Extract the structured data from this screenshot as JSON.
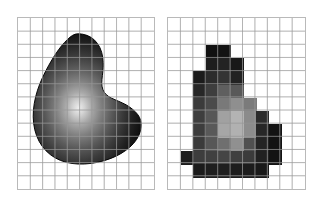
{
  "figure": {
    "background_color": "#ffffff",
    "panel_border_color": "#b9b9b9",
    "grid_line_color": "#9a9a9a",
    "grid_minor_color": "#c8c8c8",
    "caption": "",
    "panel_count": 2
  },
  "panels": [
    {
      "id": "continuous",
      "name": "continuous-shaded-shape",
      "label": "",
      "x": 17,
      "y": 17,
      "width": 138,
      "height": 173,
      "grid": {
        "columns": 11,
        "rows": 13,
        "cell_width": 12.5,
        "cell_height": 13.3,
        "visible": true
      },
      "shape": {
        "type": "smooth-blob",
        "fill_mode": "radial-gradient-shaded",
        "highlight_center_x_pct": 42,
        "highlight_center_y_pct": 57,
        "highlight_color": "#e8e8e8",
        "mid_color": "#6e6e6e",
        "edge_color": "#111111",
        "outline_color": "#000000"
      }
    },
    {
      "id": "pixelated",
      "name": "pixelated-quantized-shape",
      "label": "",
      "x": 167,
      "y": 17,
      "width": 139,
      "height": 173,
      "grid": {
        "columns": 11,
        "rows": 13,
        "cell_width": 12.6,
        "cell_height": 13.3,
        "visible": true
      },
      "shape": {
        "type": "pixel-mosaic",
        "fill_mode": "quantized-grayscale",
        "palette": [
          "#0d0d0d",
          "#1f1f1f",
          "#2e2e2e",
          "#3d3d3d",
          "#4d4d4d",
          "#5c5c5c",
          "#707070",
          "#858585",
          "#9b9b9b",
          "#b2b2b2",
          "#c2c2c2"
        ]
      }
    }
  ],
  "chart_data": {
    "type": "heatmap",
    "title": "",
    "subtitle": "",
    "xlabel": "",
    "ylabel": "",
    "legend": [],
    "grid": true,
    "columns": 11,
    "rows": 13,
    "cell_matrix": [
      [
        null,
        null,
        null,
        null,
        null,
        null,
        null,
        null,
        null,
        null,
        null
      ],
      [
        null,
        null,
        null,
        null,
        null,
        null,
        null,
        null,
        null,
        null,
        null
      ],
      [
        null,
        null,
        null,
        "#121212",
        "#121212",
        null,
        null,
        null,
        null,
        null,
        null
      ],
      [
        null,
        null,
        null,
        "#1d1d1d",
        "#212121",
        "#1a1a1a",
        null,
        null,
        null,
        null,
        null
      ],
      [
        null,
        null,
        "#1c1c1c",
        "#2b2b2b",
        "#323232",
        "#242424",
        null,
        null,
        null,
        null,
        null
      ],
      [
        null,
        null,
        "#262626",
        "#3d3d3d",
        "#5e5e5e",
        "#585858",
        null,
        null,
        null,
        null,
        null
      ],
      [
        null,
        null,
        "#3a3a3a",
        "#4a4a4a",
        "#787878",
        "#8e8e8e",
        "#7a7a7a",
        null,
        null,
        null,
        null
      ],
      [
        null,
        null,
        "#3d3d3d",
        "#565656",
        "#a0a0a0",
        "#b2b2b2",
        "#8a8a8a",
        "#2b2b2b",
        null,
        null,
        null
      ],
      [
        null,
        null,
        "#3c3c3c",
        "#585858",
        "#a5a5a5",
        "#b0b0b0",
        "#8c8c8c",
        "#262626",
        "#121212",
        null,
        null
      ],
      [
        null,
        null,
        "#3a3a3a",
        "#565656",
        "#6e6e6e",
        "#8f8f8f",
        "#4f4f4f",
        "#232323",
        "#121212",
        null,
        null
      ],
      [
        null,
        "#1c1c1c",
        "#3c3c3c",
        "#3f3f3f",
        "#444444",
        "#3e3e3e",
        "#3a3a3a",
        "#202020",
        "#121212",
        null,
        null
      ],
      [
        null,
        null,
        "#1a1a1a",
        "#1d1d1d",
        "#1e1e1e",
        "#1c1c1c",
        "#1b1b1b",
        "#181818",
        null,
        null,
        null
      ],
      [
        null,
        null,
        null,
        null,
        null,
        null,
        null,
        null,
        null,
        null,
        null
      ]
    ]
  },
  "pixel_cells": [
    {
      "c": 3,
      "r": 2,
      "color": "#111111"
    },
    {
      "c": 4,
      "r": 2,
      "color": "#131313"
    },
    {
      "c": 3,
      "r": 3,
      "color": "#1e1e1e"
    },
    {
      "c": 4,
      "r": 3,
      "color": "#232323"
    },
    {
      "c": 5,
      "r": 3,
      "color": "#181818"
    },
    {
      "c": 2,
      "r": 4,
      "color": "#1b1b1b"
    },
    {
      "c": 3,
      "r": 4,
      "color": "#2c2c2c"
    },
    {
      "c": 4,
      "r": 4,
      "color": "#343434"
    },
    {
      "c": 5,
      "r": 4,
      "color": "#222222"
    },
    {
      "c": 2,
      "r": 5,
      "color": "#272727"
    },
    {
      "c": 3,
      "r": 5,
      "color": "#3e3e3e"
    },
    {
      "c": 4,
      "r": 5,
      "color": "#5f5f5f"
    },
    {
      "c": 5,
      "r": 5,
      "color": "#595959"
    },
    {
      "c": 2,
      "r": 6,
      "color": "#3b3b3b"
    },
    {
      "c": 3,
      "r": 6,
      "color": "#4b4b4b"
    },
    {
      "c": 4,
      "r": 6,
      "color": "#797979"
    },
    {
      "c": 5,
      "r": 6,
      "color": "#8f8f8f"
    },
    {
      "c": 6,
      "r": 6,
      "color": "#7b7b7b"
    },
    {
      "c": 2,
      "r": 7,
      "color": "#3e3e3e"
    },
    {
      "c": 3,
      "r": 7,
      "color": "#575757"
    },
    {
      "c": 4,
      "r": 7,
      "color": "#a1a1a1"
    },
    {
      "c": 5,
      "r": 7,
      "color": "#b3b3b3"
    },
    {
      "c": 6,
      "r": 7,
      "color": "#8b8b8b"
    },
    {
      "c": 7,
      "r": 7,
      "color": "#2c2c2c"
    },
    {
      "c": 2,
      "r": 8,
      "color": "#3d3d3d"
    },
    {
      "c": 3,
      "r": 8,
      "color": "#595959"
    },
    {
      "c": 4,
      "r": 8,
      "color": "#a6a6a6"
    },
    {
      "c": 5,
      "r": 8,
      "color": "#b1b1b1"
    },
    {
      "c": 6,
      "r": 8,
      "color": "#8d8d8d"
    },
    {
      "c": 7,
      "r": 8,
      "color": "#272727"
    },
    {
      "c": 8,
      "r": 8,
      "color": "#131313"
    },
    {
      "c": 2,
      "r": 9,
      "color": "#3b3b3b"
    },
    {
      "c": 3,
      "r": 9,
      "color": "#575757"
    },
    {
      "c": 4,
      "r": 9,
      "color": "#6f6f6f"
    },
    {
      "c": 5,
      "r": 9,
      "color": "#909090"
    },
    {
      "c": 6,
      "r": 9,
      "color": "#505050"
    },
    {
      "c": 7,
      "r": 9,
      "color": "#242424"
    },
    {
      "c": 8,
      "r": 9,
      "color": "#131313"
    },
    {
      "c": 1,
      "r": 10,
      "color": "#1d1d1d"
    },
    {
      "c": 2,
      "r": 10,
      "color": "#3d3d3d"
    },
    {
      "c": 3,
      "r": 10,
      "color": "#404040"
    },
    {
      "c": 4,
      "r": 10,
      "color": "#454545"
    },
    {
      "c": 5,
      "r": 10,
      "color": "#3f3f3f"
    },
    {
      "c": 6,
      "r": 10,
      "color": "#3b3b3b"
    },
    {
      "c": 7,
      "r": 10,
      "color": "#212121"
    },
    {
      "c": 8,
      "r": 10,
      "color": "#131313"
    },
    {
      "c": 2,
      "r": 11,
      "color": "#1b1b1b"
    },
    {
      "c": 3,
      "r": 11,
      "color": "#1e1e1e"
    },
    {
      "c": 4,
      "r": 11,
      "color": "#1f1f1f"
    },
    {
      "c": 5,
      "r": 11,
      "color": "#1d1d1d"
    },
    {
      "c": 6,
      "r": 11,
      "color": "#1c1c1c"
    },
    {
      "c": 7,
      "r": 11,
      "color": "#191919"
    }
  ]
}
